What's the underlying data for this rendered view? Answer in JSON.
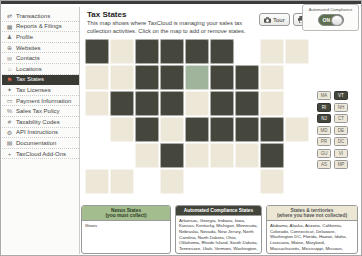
{
  "sidebar": {
    "items": [
      {
        "label": "Transactions",
        "icon": "transactions-icon",
        "selected": false
      },
      {
        "label": "Reports & Filings",
        "icon": "reports-filings-icon",
        "selected": false
      },
      {
        "label": "Profile",
        "icon": "profile-icon",
        "selected": false
      },
      {
        "label": "Websites",
        "icon": "websites-icon",
        "selected": false
      },
      {
        "label": "Contacts",
        "icon": "contacts-icon",
        "selected": false
      },
      {
        "label": "Locations",
        "icon": "locations-icon",
        "selected": false
      },
      {
        "label": "Tax States",
        "icon": "tax-states-icon",
        "selected": true
      },
      {
        "label": "Tax Licenses",
        "icon": "tax-licenses-icon",
        "selected": false
      },
      {
        "label": "Payment Information",
        "icon": "payment-icon",
        "selected": false
      },
      {
        "label": "Sales Tax Policy",
        "icon": "sales-tax-policy-icon",
        "selected": false
      },
      {
        "label": "Taxability Codes",
        "icon": "taxability-codes-icon",
        "selected": false
      },
      {
        "label": "API Instructions",
        "icon": "api-icon",
        "selected": false
      },
      {
        "label": "Documentation",
        "icon": "documentation-icon",
        "selected": false
      },
      {
        "label": "TaxCloud Add-Ons",
        "icon": "addons-icon",
        "selected": false
      }
    ]
  },
  "header": {
    "title": "Tax States",
    "description": "This map shows where TaxCloud is managing your sales tax collection activities. Click on the map to add or remove states.",
    "tour_label": "Tour",
    "print_label": "Print",
    "toggle_label": "Automated Compliance",
    "toggle_state": "ON"
  },
  "map": {
    "colors": {
      "nexus": "#9fb49a",
      "compliance": "#45473c",
      "none": "#ece7d6"
    },
    "tiles": [
      {
        "id": "WA",
        "col": 0,
        "row": 0,
        "cat": "compliance"
      },
      {
        "id": "MT",
        "col": 1,
        "row": 0,
        "cat": "none"
      },
      {
        "id": "ND",
        "col": 2,
        "row": 0,
        "cat": "compliance"
      },
      {
        "id": "MN",
        "col": 3,
        "row": 0,
        "cat": "compliance"
      },
      {
        "id": "WI",
        "col": 4,
        "row": 0,
        "cat": "compliance"
      },
      {
        "id": "MI",
        "col": 5,
        "row": 0,
        "cat": "compliance"
      },
      {
        "id": "NY",
        "col": 7,
        "row": 0,
        "cat": "none"
      },
      {
        "id": "ME",
        "col": 8,
        "row": 0,
        "cat": "none"
      },
      {
        "id": "OR",
        "col": 0,
        "row": 1,
        "cat": "none"
      },
      {
        "id": "ID",
        "col": 1,
        "row": 1,
        "cat": "none"
      },
      {
        "id": "SD",
        "col": 2,
        "row": 1,
        "cat": "compliance"
      },
      {
        "id": "IA",
        "col": 3,
        "row": 1,
        "cat": "compliance"
      },
      {
        "id": "IL",
        "col": 4,
        "row": 1,
        "cat": "nexus"
      },
      {
        "id": "IN",
        "col": 5,
        "row": 1,
        "cat": "compliance"
      },
      {
        "id": "OH",
        "col": 6,
        "row": 1,
        "cat": "compliance"
      },
      {
        "id": "PA",
        "col": 7,
        "row": 1,
        "cat": "none"
      },
      {
        "id": "CA",
        "col": 0,
        "row": 2,
        "cat": "none"
      },
      {
        "id": "NV",
        "col": 1,
        "row": 2,
        "cat": "compliance"
      },
      {
        "id": "WY",
        "col": 2,
        "row": 2,
        "cat": "compliance"
      },
      {
        "id": "NE",
        "col": 3,
        "row": 2,
        "cat": "compliance"
      },
      {
        "id": "MO",
        "col": 4,
        "row": 2,
        "cat": "none"
      },
      {
        "id": "KY",
        "col": 5,
        "row": 2,
        "cat": "compliance"
      },
      {
        "id": "WV",
        "col": 6,
        "row": 2,
        "cat": "compliance"
      },
      {
        "id": "VA",
        "col": 7,
        "row": 2,
        "cat": "none"
      },
      {
        "id": "AZ",
        "col": 1,
        "row": 3,
        "cat": "none"
      },
      {
        "id": "UT",
        "col": 2,
        "row": 3,
        "cat": "compliance"
      },
      {
        "id": "CO",
        "col": 3,
        "row": 3,
        "cat": "none"
      },
      {
        "id": "KS",
        "col": 4,
        "row": 3,
        "cat": "compliance"
      },
      {
        "id": "AR",
        "col": 5,
        "row": 3,
        "cat": "compliance"
      },
      {
        "id": "TN",
        "col": 6,
        "row": 3,
        "cat": "compliance"
      },
      {
        "id": "NC",
        "col": 7,
        "row": 3,
        "cat": "compliance"
      },
      {
        "id": "SC",
        "col": 8,
        "row": 3,
        "cat": "none"
      },
      {
        "id": "NM",
        "col": 2,
        "row": 4,
        "cat": "none"
      },
      {
        "id": "OK",
        "col": 3,
        "row": 4,
        "cat": "compliance"
      },
      {
        "id": "LA",
        "col": 4,
        "row": 4,
        "cat": "none"
      },
      {
        "id": "MS",
        "col": 5,
        "row": 4,
        "cat": "none"
      },
      {
        "id": "AL",
        "col": 6,
        "row": 4,
        "cat": "none"
      },
      {
        "id": "GA",
        "col": 7,
        "row": 4,
        "cat": "compliance"
      },
      {
        "id": "AK",
        "col": 0,
        "row": 5,
        "cat": "none"
      },
      {
        "id": "HI",
        "col": 1,
        "row": 5,
        "cat": "none"
      },
      {
        "id": "TX",
        "col": 3,
        "row": 5,
        "cat": "none"
      },
      {
        "id": "FL",
        "col": 7,
        "row": 5,
        "cat": "none"
      }
    ],
    "side_boxes": {
      "col_a": [
        {
          "id": "MA",
          "cat": "none"
        },
        {
          "id": "RI",
          "cat": "compliance"
        },
        {
          "id": "NJ",
          "cat": "compliance"
        },
        {
          "id": "MD",
          "cat": "none"
        },
        {
          "id": "PR",
          "cat": "none"
        },
        {
          "id": "GU",
          "cat": "none"
        },
        {
          "id": "AS",
          "cat": "none"
        }
      ],
      "col_b": [
        {
          "id": "VT",
          "cat": "compliance"
        },
        {
          "id": "NH",
          "cat": "none"
        },
        {
          "id": "CT",
          "cat": "none"
        },
        {
          "id": "DE",
          "cat": "none"
        },
        {
          "id": "DC",
          "cat": "none"
        },
        {
          "id": "VI",
          "cat": "none"
        },
        {
          "id": "MP",
          "cat": "none"
        }
      ]
    }
  },
  "legend": {
    "boxes": [
      {
        "title": "Nexus States",
        "subtitle": "(you must collect)",
        "content": "Illinois"
      },
      {
        "title": "Automated Compliance States",
        "subtitle": "",
        "content": "Arkansas, Georgia, Indiana, Iowa, Kansas, Kentucky, Michigan, Minnesota, Nebraska, Nevada, New Jersey, North Carolina, North Dakota, Ohio, Oklahoma, Rhode Island, South Dakota, Tennessee, Utah, Vermont, Washington, West Virginia, Wisconsin, Wyoming"
      },
      {
        "title": "States & territories",
        "subtitle": "(where you have not collected)",
        "content": "Alabama, Alaska, Arizona, California, Colorado, Connecticut, Delaware, Washington DC, Florida, Hawaii, Idaho, Louisiana, Maine, Maryland, Massachusetts, Mississippi, Missouri, Montana, New Hampshire, New Mexico, New York, Oregon, Pennsylvania, South Carolina, Texas, Virginia, Guam, Puerto Rico, U.S. Virgin Islands"
      }
    ]
  }
}
